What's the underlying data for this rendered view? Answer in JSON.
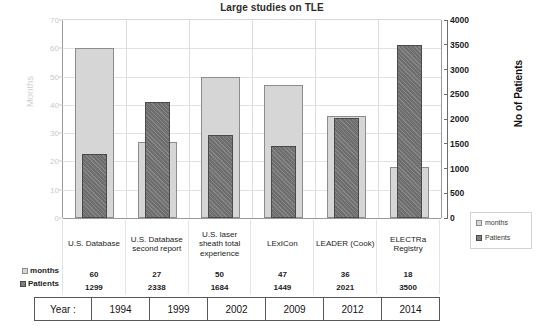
{
  "chart_data": {
    "type": "bar",
    "title": "Large studies on TLE",
    "xlabel": "",
    "ylabel": "Months",
    "y2label": "No of Patients",
    "categories": [
      "U.S. Database",
      "U.S. Database second report",
      "U.S. laser sheath total experience",
      "LExICon",
      "LEADER (Cook)",
      "ELECTRa Registry"
    ],
    "series": [
      {
        "name": "months",
        "axis": "left",
        "color": "#d6d6d6",
        "values": [
          60,
          27,
          50,
          47,
          36,
          18
        ]
      },
      {
        "name": "Patients",
        "axis": "right",
        "color": "#757575",
        "values": [
          1299,
          2338,
          1684,
          1449,
          2021,
          3500
        ]
      }
    ],
    "ylim": [
      0,
      70
    ],
    "yticks": [
      0,
      10,
      20,
      30,
      40,
      50,
      60,
      70
    ],
    "y2lim": [
      0,
      4000
    ],
    "y2ticks": [
      0,
      500,
      1000,
      1500,
      2000,
      2500,
      3000,
      3500,
      4000
    ],
    "grid": true,
    "legend_position": "right-bottom"
  },
  "title": "Large studies on TLE",
  "axes": {
    "left_title": "Months",
    "right_title": "No of Patients",
    "left_ticks": [
      "0",
      "10",
      "20",
      "30",
      "40",
      "50",
      "60",
      "70"
    ],
    "right_ticks": [
      "0",
      "500",
      "1000",
      "1500",
      "2000",
      "2500",
      "3000",
      "3500",
      "4000"
    ]
  },
  "legend": {
    "items": [
      {
        "label": "months"
      },
      {
        "label": "Patients"
      }
    ]
  },
  "table": {
    "categories": [
      "U.S. Database",
      "U.S. Database second report",
      "U.S. laser sheath total experience",
      "LExICon",
      "LEADER (Cook)",
      "ELECTRa Registry"
    ],
    "rows": [
      {
        "label": "months",
        "values": [
          "60",
          "27",
          "50",
          "47",
          "36",
          "18"
        ]
      },
      {
        "label": "Patients",
        "values": [
          "1299",
          "2338",
          "1684",
          "1449",
          "2021",
          "3500"
        ]
      }
    ],
    "year_label": "Year :",
    "years": [
      "1994",
      "1999",
      "2002",
      "2009",
      "2012",
      "2014"
    ]
  }
}
